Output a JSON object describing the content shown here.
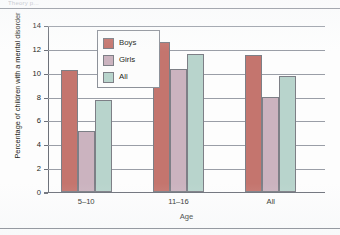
{
  "page": {
    "top_sliver_text": "Theory p..."
  },
  "chart_data": {
    "type": "bar",
    "title": "",
    "xlabel": "Age",
    "ylabel": "Percentage of children with a mental disorder",
    "categories": [
      "5–10",
      "11–16",
      "All"
    ],
    "series": [
      {
        "name": "Boys",
        "color": "#c4756e",
        "values": [
          10.2,
          12.6,
          11.5
        ]
      },
      {
        "name": "Girls",
        "color": "#cbb3bf",
        "values": [
          5.1,
          10.3,
          8.0
        ]
      },
      {
        "name": "All",
        "color": "#b8d4cc",
        "values": [
          7.7,
          11.6,
          9.7
        ]
      }
    ],
    "ylim": [
      0,
      14
    ],
    "yticks": [
      0,
      2,
      4,
      6,
      8,
      10,
      12,
      14
    ],
    "ytick_labels": [
      "0",
      "2",
      "4",
      "6",
      "8",
      "10",
      "12",
      "14"
    ],
    "grid": true,
    "legend_position": "upper-center-left",
    "legend_entries": [
      "Boys",
      "Girls",
      "All"
    ]
  }
}
